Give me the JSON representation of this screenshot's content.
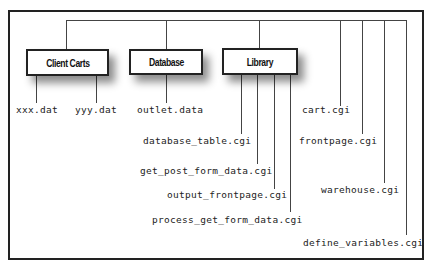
{
  "diagram": {
    "boxes": [
      {
        "id": "client-carts",
        "label": "Client Carts"
      },
      {
        "id": "database",
        "label": "Database"
      },
      {
        "id": "library",
        "label": "Library"
      }
    ],
    "client_carts_files": [
      "xxx.dat",
      "yyy.dat"
    ],
    "database_files": [
      "outlet.data"
    ],
    "library_files": [
      "database_table.cgi",
      "get_post_form_data.cgi",
      "output_frontpage.cgi",
      "process_get_form_data.cgi"
    ],
    "root_files": [
      "cart.cgi",
      "frontpage.cgi",
      "warehouse.cgi",
      "define_variables.cgi"
    ],
    "colors": {
      "line": "#444444",
      "border": "#222222",
      "background": "#ffffff"
    }
  }
}
